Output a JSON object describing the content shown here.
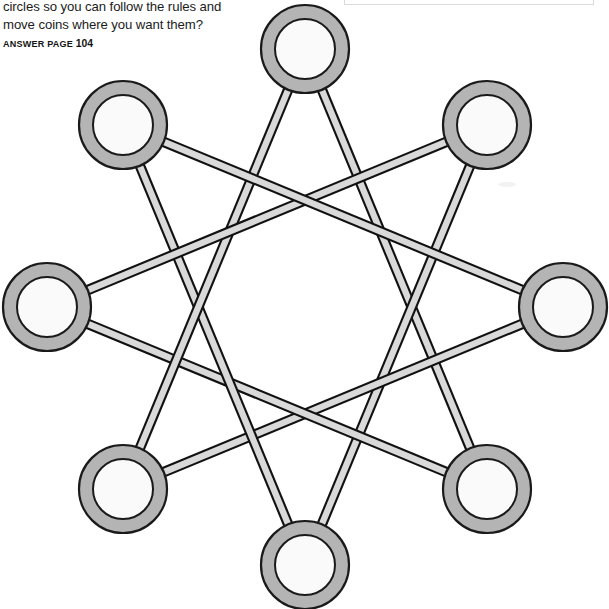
{
  "page": {
    "background_color": "#ffffff",
    "width": 609,
    "height": 609
  },
  "text_block": {
    "line1": "circles so you can follow the rules and",
    "line2": "move coins where you want them?",
    "answer_label": "ANSWER PAGE",
    "answer_page": "104"
  },
  "diagram": {
    "type": "star-polygon-graph",
    "node_count": 8,
    "schlafli": "{8/3}",
    "skip": 3,
    "ring_center": {
      "x": 305,
      "y": 307
    },
    "ring_radius": 258,
    "start_angle_deg": -90,
    "step_angle_deg": 45,
    "node_outer_radius": 44,
    "node_inner_radius": 30,
    "strut_half_width": 4.2,
    "colors": {
      "node_ring_fill": "#b4b4b4",
      "node_center_fill": "#fafafa",
      "node_stroke": "#1a1a1a",
      "strut_fill": "#d9d9d9",
      "strut_stroke": "#111111",
      "page_background": "#ffffff",
      "crop_box_border": "#d9d9d9"
    },
    "nodes": [
      {
        "id": "n0",
        "label": "top",
        "x": 305,
        "y": 49,
        "angle_deg": -90
      },
      {
        "id": "n1",
        "label": "top-right",
        "x": 487,
        "y": 125,
        "angle_deg": -45
      },
      {
        "id": "n2",
        "label": "right",
        "x": 563,
        "y": 307,
        "angle_deg": 0
      },
      {
        "id": "n3",
        "label": "bottom-right",
        "x": 487,
        "y": 489,
        "angle_deg": 45
      },
      {
        "id": "n4",
        "label": "bottom",
        "x": 305,
        "y": 565,
        "angle_deg": 90
      },
      {
        "id": "n5",
        "label": "bottom-left",
        "x": 123,
        "y": 489,
        "angle_deg": 135
      },
      {
        "id": "n6",
        "label": "left",
        "x": 47,
        "y": 307,
        "angle_deg": 180
      },
      {
        "id": "n7",
        "label": "top-left",
        "x": 123,
        "y": 125,
        "angle_deg": 225
      }
    ],
    "edges": [
      {
        "from": "n0",
        "to": "n3"
      },
      {
        "from": "n1",
        "to": "n4"
      },
      {
        "from": "n2",
        "to": "n5"
      },
      {
        "from": "n3",
        "to": "n6"
      },
      {
        "from": "n4",
        "to": "n7"
      },
      {
        "from": "n5",
        "to": "n0"
      },
      {
        "from": "n6",
        "to": "n1"
      },
      {
        "from": "n7",
        "to": "n2"
      }
    ]
  }
}
